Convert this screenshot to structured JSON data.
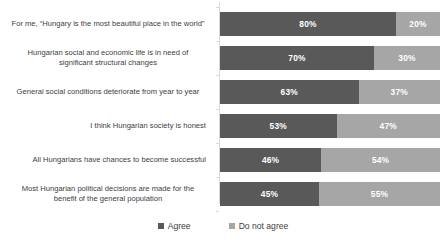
{
  "chart_data": {
    "type": "bar",
    "subtype": "stacked-horizontal-100",
    "title": "",
    "xlabel": "",
    "ylabel": "",
    "xlim": [
      0,
      100
    ],
    "grid": false,
    "legend_position": "bottom",
    "categories": [
      "For me, “Hungary is the most beautiful place in the world”",
      "Hungarian social and economic life is in need of significant structural changes",
      "General social conditions deteriorate from year to year",
      "I think Hungarian society is honest",
      "All Hungarians have chances to become successful",
      "Most Hungarian political decisions are made for the benefit of the general population"
    ],
    "series": [
      {
        "name": "Agree",
        "color": "#595959",
        "values": [
          80,
          70,
          63,
          53,
          46,
          45
        ]
      },
      {
        "name": "Do not agree",
        "color": "#a6a6a6",
        "values": [
          20,
          30,
          37,
          47,
          54,
          55
        ]
      }
    ],
    "value_labels": [
      {
        "agree": "80%",
        "disagree": "20%"
      },
      {
        "agree": "70%",
        "disagree": "30%"
      },
      {
        "agree": "63%",
        "disagree": "37%"
      },
      {
        "agree": "53%",
        "disagree": "47%"
      },
      {
        "agree": "46%",
        "disagree": "54%"
      },
      {
        "agree": "45%",
        "disagree": "55%"
      }
    ]
  },
  "legend": {
    "items": [
      {
        "label": "Agree"
      },
      {
        "label": "Do not agree"
      }
    ]
  }
}
